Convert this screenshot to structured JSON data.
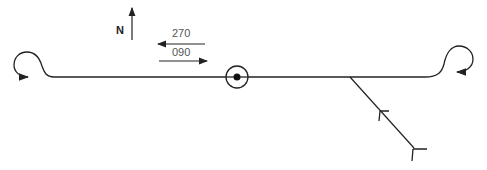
{
  "diagram": {
    "type": "holding/procedure track diagram",
    "north_label": "N",
    "track_labels": [
      {
        "text": "270",
        "direction": "west"
      },
      {
        "text": "090",
        "direction": "east"
      }
    ],
    "fix": "VOR station (circle with dot)",
    "elements": [
      "left procedure turn loop",
      "right procedure turn loop",
      "inbound intercept track with arrow chevrons"
    ],
    "colors": {
      "line": "#222222",
      "label": "#555555",
      "background": "#ffffff"
    }
  }
}
